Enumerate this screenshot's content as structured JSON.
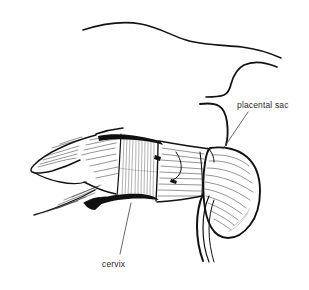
{
  "figure": {
    "type": "line-drawing",
    "background_color": "#ffffff",
    "ink_color": "#121212",
    "label_color": "#2b2b2b",
    "width": 309,
    "height": 290
  },
  "labels": [
    {
      "id": "placental-sac",
      "text": "placental sac",
      "x": 237,
      "y": 100,
      "leader": {
        "from_x": 248,
        "from_y": 112,
        "to_x": 222,
        "to_y": 148
      }
    },
    {
      "id": "cervix",
      "text": "cervix",
      "x": 102,
      "y": 259,
      "leader": {
        "from_x": 120,
        "from_y": 254,
        "to_x": 131,
        "to_y": 203
      }
    }
  ],
  "structures": [
    {
      "name": "body-wall-upper-contour",
      "description": "long sweeping contour across top of image"
    },
    {
      "name": "body-wall-lower-contour",
      "description": "S-shaped curve descending at right"
    },
    {
      "name": "uterine-horn-left",
      "description": "pointed horn at left end"
    },
    {
      "name": "uterus-body",
      "description": "hatched tubular body"
    },
    {
      "name": "cervix-band",
      "description": "banded segment with dark upper and lower edges"
    },
    {
      "name": "placental-sac",
      "description": "bulbous hatched sac at right"
    },
    {
      "name": "vagina-channel",
      "description": "paired curved lines descending at lower right"
    }
  ]
}
